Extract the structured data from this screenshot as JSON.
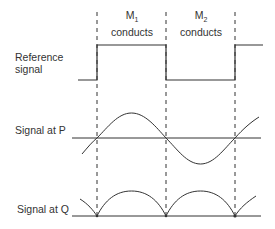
{
  "labels": {
    "reference_line1": "Reference",
    "reference_line2": "signal",
    "signal_p": "Signal at P",
    "signal_q": "Signal at Q"
  },
  "phases": [
    {
      "device": "M",
      "subscript": "1",
      "text": "conducts"
    },
    {
      "device": "M",
      "subscript": "2",
      "text": "conducts"
    }
  ],
  "colors": {
    "line": "#333333",
    "dash": "#333333",
    "background": "#ffffff"
  }
}
